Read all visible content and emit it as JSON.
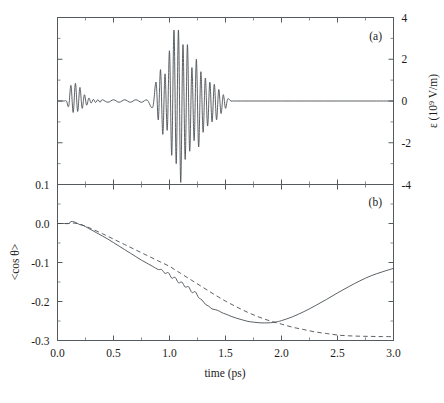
{
  "figure": {
    "panels": [
      {
        "id": "a",
        "label": "(a)",
        "axis_right_label": "ε (10⁹ V/m)",
        "y_ticks": [
          "4",
          "2",
          "0",
          "-2",
          "-4"
        ]
      },
      {
        "id": "b",
        "label": "(b)",
        "axis_left_label": "<cos θ>",
        "y_ticks": [
          "0.1",
          "0.0",
          "-0.1",
          "-0.2",
          "-0.3"
        ],
        "x_axis_label": "time (ps)",
        "x_ticks": [
          "0.0",
          "0.5",
          "1.0",
          "1.5",
          "2.0",
          "2.5",
          "3.0"
        ]
      }
    ]
  },
  "chart_data": [
    {
      "type": "line",
      "panel": "a",
      "title": "(a)",
      "xlabel": "time (ps)",
      "ylabel": "ε (10⁹ V/m)",
      "xlim": [
        0.0,
        3.0
      ],
      "ylim": [
        -4,
        4
      ],
      "yticks": [
        4,
        2,
        0,
        -2,
        -4
      ],
      "xticks": [
        0.0,
        0.5,
        1.0,
        1.5,
        2.0,
        2.5,
        3.0
      ],
      "grid": false,
      "legend": "none",
      "axis_side": "right",
      "description": "Two-pulse laser electric field: a weak precursor pulse near 0.1-0.35 ps with small amplitude ripples persisting to ~0.85 ps, then an intense chirped pulse centred near 1.05-1.15 ps reaching +3.4 and -3.9, decaying to zero by ~1.55 ps; flat zero thereafter.",
      "series": [
        {
          "name": "electric field",
          "style": "solid",
          "points_x": [
            0.0,
            0.02,
            0.04,
            0.06,
            0.08,
            0.1,
            0.12,
            0.14,
            0.16,
            0.18,
            0.2,
            0.22,
            0.24,
            0.26,
            0.28,
            0.3,
            0.32,
            0.34,
            0.36,
            0.38,
            0.4,
            0.45,
            0.5,
            0.55,
            0.6,
            0.65,
            0.7,
            0.75,
            0.8,
            0.85,
            0.88,
            0.9,
            0.92,
            0.94,
            0.96,
            0.98,
            1.0,
            1.02,
            1.04,
            1.06,
            1.08,
            1.1,
            1.12,
            1.14,
            1.16,
            1.18,
            1.2,
            1.22,
            1.24,
            1.26,
            1.28,
            1.3,
            1.32,
            1.34,
            1.36,
            1.38,
            1.4,
            1.42,
            1.44,
            1.46,
            1.48,
            1.5,
            1.52,
            1.55,
            1.6,
            2.0,
            2.5,
            3.0
          ],
          "points_y": [
            0,
            0,
            0,
            0,
            0,
            -0.25,
            0.75,
            -0.55,
            0.85,
            -0.5,
            0.65,
            -0.35,
            0.3,
            -0.2,
            0.14,
            -0.1,
            0.08,
            -0.07,
            0.06,
            -0.06,
            0.06,
            -0.06,
            0.06,
            -0.06,
            0.06,
            -0.06,
            0.06,
            -0.06,
            0.05,
            -0.3,
            0.9,
            -0.9,
            1.5,
            -1.6,
            1.3,
            -1.4,
            2.4,
            -2.6,
            3.4,
            -3.0,
            3.4,
            -3.9,
            2.7,
            -2.8,
            2.7,
            -2.4,
            1.6,
            -1.9,
            2.0,
            -2.2,
            1.4,
            -1.5,
            1.1,
            -1.2,
            0.9,
            -1.0,
            0.8,
            -0.9,
            0.55,
            -0.6,
            0.3,
            -0.35,
            0.1,
            0,
            0,
            0,
            0,
            0
          ]
        }
      ]
    },
    {
      "type": "line",
      "panel": "b",
      "title": "(b)",
      "xlabel": "time (ps)",
      "ylabel": "<cos θ>",
      "xlim": [
        0.0,
        3.0
      ],
      "ylim": [
        -0.3,
        0.1
      ],
      "yticks": [
        0.1,
        0.0,
        -0.1,
        -0.2,
        -0.3
      ],
      "xticks": [
        0.0,
        0.5,
        1.0,
        1.5,
        2.0,
        2.5,
        3.0
      ],
      "grid": false,
      "legend": "none",
      "description": "Alignment cosine expectation value. Solid curve falls nearly linearly from 0 to about -0.13 by 1.0 ps with step-like oscillations from 0.95-1.45 ps, reaches a minimum of about -0.255 near 1.85 ps then rises to -0.115 at 3.0 ps. Dashed curve declines smoothly to a plateau of about -0.29 beyond 2.6 ps.",
      "series": [
        {
          "name": "solid",
          "style": "solid",
          "points_x": [
            0.0,
            0.05,
            0.1,
            0.12,
            0.15,
            0.18,
            0.2,
            0.22,
            0.25,
            0.3,
            0.35,
            0.4,
            0.45,
            0.5,
            0.55,
            0.6,
            0.65,
            0.7,
            0.75,
            0.8,
            0.85,
            0.9,
            0.93,
            0.96,
            0.99,
            1.02,
            1.05,
            1.08,
            1.11,
            1.14,
            1.17,
            1.2,
            1.23,
            1.26,
            1.29,
            1.32,
            1.35,
            1.38,
            1.41,
            1.44,
            1.47,
            1.5,
            1.55,
            1.6,
            1.65,
            1.7,
            1.75,
            1.8,
            1.85,
            1.9,
            1.95,
            2.0,
            2.1,
            2.2,
            2.3,
            2.4,
            2.5,
            2.6,
            2.7,
            2.8,
            2.9,
            3.0
          ],
          "points_y": [
            0.0,
            0.0,
            0.0,
            0.005,
            0.004,
            0.0,
            -0.003,
            -0.004,
            -0.008,
            -0.016,
            -0.024,
            -0.032,
            -0.04,
            -0.049,
            -0.058,
            -0.067,
            -0.076,
            -0.085,
            -0.094,
            -0.102,
            -0.11,
            -0.118,
            -0.118,
            -0.128,
            -0.126,
            -0.14,
            -0.138,
            -0.152,
            -0.15,
            -0.163,
            -0.162,
            -0.177,
            -0.175,
            -0.19,
            -0.196,
            -0.207,
            -0.212,
            -0.219,
            -0.221,
            -0.224,
            -0.229,
            -0.232,
            -0.238,
            -0.243,
            -0.247,
            -0.251,
            -0.253,
            -0.2545,
            -0.255,
            -0.2545,
            -0.2525,
            -0.249,
            -0.239,
            -0.226,
            -0.211,
            -0.195,
            -0.178,
            -0.162,
            -0.147,
            -0.134,
            -0.124,
            -0.115
          ]
        },
        {
          "name": "dashed",
          "style": "dashed",
          "points_x": [
            0.0,
            0.05,
            0.1,
            0.15,
            0.2,
            0.25,
            0.3,
            0.4,
            0.5,
            0.6,
            0.7,
            0.8,
            0.9,
            1.0,
            1.1,
            1.2,
            1.3,
            1.4,
            1.5,
            1.6,
            1.7,
            1.8,
            1.9,
            2.0,
            2.1,
            2.2,
            2.3,
            2.4,
            2.5,
            2.6,
            2.7,
            2.8,
            2.9,
            3.0
          ],
          "points_y": [
            0.0,
            0.0,
            0.0,
            0.001,
            -0.002,
            -0.007,
            -0.013,
            -0.026,
            -0.04,
            -0.054,
            -0.068,
            -0.082,
            -0.096,
            -0.11,
            -0.128,
            -0.146,
            -0.164,
            -0.182,
            -0.199,
            -0.214,
            -0.228,
            -0.24,
            -0.25,
            -0.258,
            -0.266,
            -0.272,
            -0.278,
            -0.282,
            -0.286,
            -0.288,
            -0.289,
            -0.2895,
            -0.29,
            -0.29
          ]
        }
      ]
    }
  ]
}
